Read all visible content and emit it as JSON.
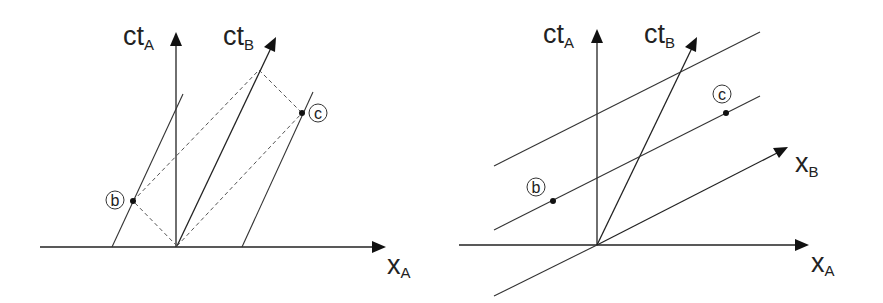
{
  "figure": {
    "left_panel": {
      "axes": {
        "time_A": {
          "main": "ct",
          "sub": "A"
        },
        "time_B": {
          "main": "ct",
          "sub": "B"
        },
        "space_A": {
          "main": "x",
          "sub": "A"
        }
      },
      "events": [
        {
          "label": "b"
        },
        {
          "label": "c"
        }
      ],
      "description": "Worldlines parallel to ct_B through events b and c, with dashed light-ray construction from origin"
    },
    "right_panel": {
      "axes": {
        "time_A": {
          "main": "ct",
          "sub": "A"
        },
        "time_B": {
          "main": "ct",
          "sub": "B"
        },
        "space_A": {
          "main": "x",
          "sub": "A"
        },
        "space_B": {
          "main": "x",
          "sub": "B"
        }
      },
      "events": [
        {
          "label": "b"
        },
        {
          "label": "c"
        }
      ],
      "description": "Lines of simultaneity parallel to x_B; events b and c lie on the same simultaneity line"
    }
  }
}
